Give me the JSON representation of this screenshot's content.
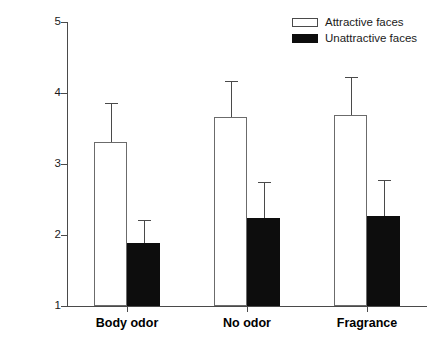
{
  "chart_data": {
    "type": "bar",
    "title": "",
    "xlabel": "",
    "ylabel": "Attractiveness Rating",
    "categories": [
      "Body odor",
      "No odor",
      "Fragrance"
    ],
    "ylim": [
      1,
      5
    ],
    "yticks": [
      1,
      2,
      3,
      4,
      5
    ],
    "ytick_labels": [
      "1",
      "2",
      "3",
      "4",
      "5"
    ],
    "grid": false,
    "legend_position": "top-right",
    "error_bar_type": "upper-only",
    "series": [
      {
        "name": "Attractive faces",
        "style": "open",
        "color": "#ffffff",
        "edge_color": "#6b6b6b",
        "values": [
          3.31,
          3.66,
          3.69
        ],
        "errors": [
          0.55,
          0.51,
          0.54
        ],
        "upper_bounds": [
          3.86,
          4.17,
          4.23
        ]
      },
      {
        "name": "Unattractive faces",
        "style": "filled",
        "color": "#0d0d0d",
        "edge_color": "#0d0d0d",
        "values": [
          1.89,
          2.24,
          2.27
        ],
        "errors": [
          0.32,
          0.51,
          0.5
        ],
        "upper_bounds": [
          2.21,
          2.75,
          2.77
        ]
      }
    ]
  },
  "legend": {
    "items": [
      {
        "label": "Attractive faces",
        "style": "open"
      },
      {
        "label": "Unattractive faces",
        "style": "filled"
      }
    ]
  },
  "axes": {
    "y_title": "Attractiveness Rating"
  }
}
